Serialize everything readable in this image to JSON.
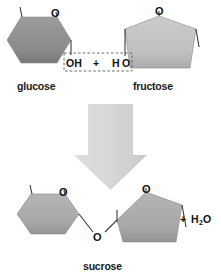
{
  "figure": {
    "type": "chemistry-reaction-diagram"
  },
  "reactants": {
    "glucose": {
      "label": "glucose",
      "ring_shape": "hexagon",
      "ring_oxygen_label": "O",
      "fill_color": "#8e8e8e",
      "reactive_group_label": "OH"
    },
    "fructose": {
      "label": "fructose",
      "ring_shape": "pentagon",
      "ring_oxygen_label": "O",
      "fill_color": "#c3c3c3",
      "reactive_group_prefix": "H",
      "reactive_group_suffix": "O"
    },
    "plus_sign": "+"
  },
  "highlight_box": {
    "present": true,
    "style": "dashed",
    "contents": "OH + H O",
    "stroke_color": "#5a5a5a"
  },
  "arrow": {
    "direction": "down",
    "fill_color": "#d6d6d6",
    "name": "reaction-arrow"
  },
  "product": {
    "sucrose": {
      "label": "sucrose",
      "left_ring_shape": "hexagon",
      "right_ring_shape": "pentagon",
      "left_ring_oxygen_label": "O",
      "right_ring_oxygen_label": "O",
      "glycosidic_oxygen_label": "O",
      "fill_color": "#a9a9a9"
    },
    "byproduct": {
      "plus": "+",
      "formula_main": "H",
      "formula_sub": "2",
      "formula_tail": "O"
    }
  },
  "colors": {
    "background": "#ffffff",
    "text": "#111111",
    "bond": "#3a3a3a",
    "glucose_fill": "#8e8e8e",
    "fructose_fill": "#c3c3c3",
    "product_fill": "#a9a9a9",
    "arrow_fill": "#d6d6d6"
  }
}
